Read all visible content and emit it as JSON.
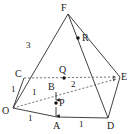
{
  "figure": {
    "stroke_color": "#2b2b2b",
    "dash_color": "#555555",
    "background": "#ffffff",
    "vertices": [
      {
        "id": "F",
        "label": "F",
        "x": 68,
        "y": 14,
        "lx": 61,
        "ly": 11,
        "dot": false
      },
      {
        "id": "C",
        "label": "C",
        "x": 24,
        "y": 78,
        "lx": 15,
        "ly": 77,
        "dot": false
      },
      {
        "id": "E",
        "label": "E",
        "x": 120,
        "y": 77,
        "lx": 122,
        "ly": 80,
        "dot": false
      },
      {
        "id": "O",
        "label": "O",
        "x": 13,
        "y": 108,
        "lx": 3,
        "ly": 113,
        "dot": false
      },
      {
        "id": "D",
        "label": "D",
        "x": 108,
        "y": 118,
        "lx": 108,
        "ly": 128,
        "dot": false
      },
      {
        "id": "A",
        "label": "A",
        "x": 57,
        "y": 117,
        "lx": 53,
        "ly": 128,
        "dot": false
      },
      {
        "id": "B",
        "label": "B",
        "x": 55,
        "y": 90,
        "lx": 49,
        "ly": 89,
        "dot": false
      },
      {
        "id": "P",
        "label": "P",
        "x": 56,
        "y": 103,
        "lx": 60,
        "ly": 105,
        "dot": true
      },
      {
        "id": "Q",
        "label": "Q",
        "x": 64,
        "y": 78,
        "lx": 59,
        "ly": 72,
        "dot": true
      },
      {
        "id": "R",
        "label": "R",
        "x": 78,
        "y": 38,
        "lx": 83,
        "ly": 40,
        "dot": true
      }
    ],
    "solid_edges": [
      {
        "name": "edge-O-F",
        "from": "O",
        "to": "F"
      },
      {
        "name": "edge-F-E",
        "from": "F",
        "to": "E"
      },
      {
        "name": "edge-F-D",
        "from": "F",
        "to": "D"
      },
      {
        "name": "edge-E-D",
        "from": "E",
        "to": "D"
      },
      {
        "name": "edge-O-C",
        "from": "O",
        "to": "C"
      },
      {
        "name": "edge-O-A",
        "from": "O",
        "to": "A"
      },
      {
        "name": "edge-A-D",
        "from": "A",
        "to": "D"
      },
      {
        "name": "edge-C-F-part",
        "from": "C",
        "to": "F"
      }
    ],
    "dashed_edges": [
      {
        "name": "edge-C-E-dashed",
        "from": "C",
        "to": "E",
        "arrow": true
      },
      {
        "name": "edge-O-E-dashed",
        "from": "O",
        "to": "E",
        "arrow": true
      }
    ],
    "measure_labels": [
      {
        "name": "length-OF",
        "text": "3",
        "x": 28,
        "y": 45
      },
      {
        "name": "length-OC",
        "text": "1",
        "x": 13,
        "y": 89
      },
      {
        "name": "length-OB",
        "text": "1",
        "x": 33,
        "y": 92
      },
      {
        "name": "length-OA",
        "text": "1",
        "x": 29,
        "y": 120
      },
      {
        "name": "length-AD",
        "text": "1",
        "x": 80,
        "y": 126
      },
      {
        "name": "length-QE",
        "text": "2",
        "x": 73,
        "y": 86
      }
    ],
    "arrow_segment": {
      "name": "segment-B-to-A-arrow",
      "from": "B",
      "to": "A",
      "x": 56,
      "y1": 91,
      "y2": 117
    }
  }
}
